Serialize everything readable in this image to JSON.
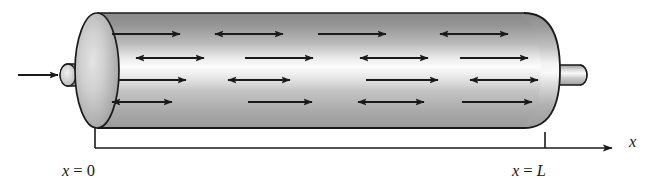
{
  "figure": {
    "title": "",
    "caption": "",
    "background_color": "#ffffff",
    "ink_color": "#1a1a1a"
  },
  "tube": {
    "name": "cylinder",
    "left_x": 75,
    "right_x": 560,
    "top_y": 13,
    "bottom_y": 128,
    "cap_rx": 22,
    "outline_color": "#1a1a1a",
    "gradient": {
      "top_color": "#8f8f8f",
      "highlight_color": "#fbfbfb",
      "bottom_color": "#a8a8a8",
      "shadow_color": "#868686"
    },
    "left_cap_label": "left-end-cap",
    "right_cap_label": "right-end-cap"
  },
  "inlet": {
    "name": "inlet-stub",
    "x": 58,
    "y": 64,
    "width": 40,
    "height": 22,
    "arrow_label": "inlet-flow-arrow",
    "arrow_x1": 18,
    "arrow_x2": 56,
    "arrow_y": 75
  },
  "outlet": {
    "name": "outlet-stub",
    "x": 556,
    "y": 64,
    "width": 32,
    "height": 20
  },
  "arrows": {
    "color": "#1a1a1a",
    "stroke_width": 2.0,
    "head_length": 9,
    "head_width": 7,
    "rows_y": [
      34,
      58,
      80,
      102
    ],
    "columns_x": [
      112,
      215,
      318,
      421
    ],
    "length": 68,
    "pattern_note": "checkerboard of single-headed (right) and double-headed arrows",
    "grid": [
      [
        "single",
        "double",
        "single",
        "double"
      ],
      [
        "double",
        "single",
        "double",
        "single"
      ],
      [
        "single",
        "double",
        "single",
        "double"
      ],
      [
        "double",
        "single",
        "double",
        "single"
      ]
    ]
  },
  "axis": {
    "name": "x-axis",
    "line_y": 148,
    "line_x1": 95,
    "line_x2": 608,
    "arrow_tip_x": 620,
    "color": "#1a1a1a",
    "label": "x",
    "label_x": 630,
    "label_y": 147,
    "ticks": [
      {
        "name": "tick-x-zero",
        "x": 95,
        "top_y": 128,
        "bottom_y": 148,
        "label": "x = 0",
        "label_var": "x",
        "label_eq": "=",
        "label_val": "0",
        "label_x": 95,
        "label_y": 172
      },
      {
        "name": "tick-x-L",
        "x": 545,
        "top_y": 133,
        "bottom_y": 148,
        "label": "x = L",
        "label_var": "x",
        "label_eq": "=",
        "label_val": "L",
        "label_x": 545,
        "label_y": 172
      }
    ]
  }
}
